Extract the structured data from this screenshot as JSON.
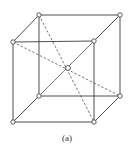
{
  "figure": {
    "caption": "(a)",
    "vertices": {
      "btl": [
        39,
        15
      ],
      "btr": [
        120,
        15
      ],
      "ftl": [
        13,
        42
      ],
      "ftr": [
        94,
        41
      ],
      "bbl": [
        39,
        96
      ],
      "bbr": [
        120,
        96
      ],
      "fbl": [
        13,
        122
      ],
      "fbr": [
        94,
        122
      ],
      "center": [
        68,
        68
      ]
    },
    "edges": [
      [
        "btl",
        "btr"
      ],
      [
        "ftl",
        "ftr"
      ],
      [
        "btl",
        "ftl"
      ],
      [
        "btr",
        "ftr"
      ],
      [
        "bbl",
        "bbr"
      ],
      [
        "fbl",
        "fbr"
      ],
      [
        "bbl",
        "fbl"
      ],
      [
        "bbr",
        "fbr"
      ],
      [
        "btl",
        "bbl"
      ],
      [
        "btr",
        "bbr"
      ],
      [
        "ftl",
        "fbl"
      ],
      [
        "ftr",
        "fbr"
      ]
    ],
    "body_diagonals": [
      [
        "btl",
        "fbr"
      ],
      [
        "btr",
        "fbl"
      ],
      [
        "ftl",
        "bbr"
      ],
      [
        "ftr",
        "bbl"
      ]
    ],
    "colors": {
      "line": "#3a3a3a",
      "atom_fill": "#ffffff"
    }
  }
}
